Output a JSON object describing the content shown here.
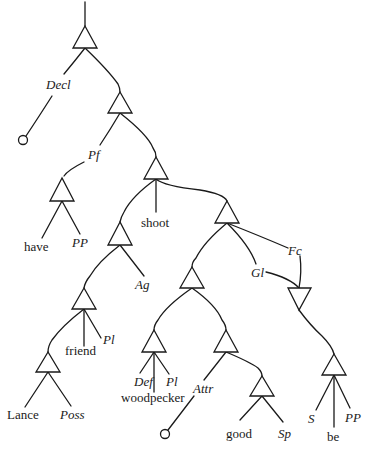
{
  "diagram": {
    "type": "syntactic-tree",
    "nodes": {
      "decl": {
        "label": "Decl"
      },
      "pf": {
        "label": "Pf"
      },
      "have": {
        "label": "have"
      },
      "pp1": {
        "label": "PP"
      },
      "shoot": {
        "label": "shoot"
      },
      "ag": {
        "label": "Ag"
      },
      "fc": {
        "label": "Fc"
      },
      "gl": {
        "label": "Gl"
      },
      "friend": {
        "label": "friend"
      },
      "pl1": {
        "label": "Pl"
      },
      "lance": {
        "label": "Lance"
      },
      "poss": {
        "label": "Poss"
      },
      "def": {
        "label": "Def"
      },
      "woodpecker": {
        "label": "woodpecker"
      },
      "pl2": {
        "label": "Pl"
      },
      "attr": {
        "label": "Attr"
      },
      "good": {
        "label": "good"
      },
      "sp": {
        "label": "Sp"
      },
      "s": {
        "label": "S"
      },
      "be": {
        "label": "be"
      },
      "pp2": {
        "label": "PP"
      }
    }
  }
}
